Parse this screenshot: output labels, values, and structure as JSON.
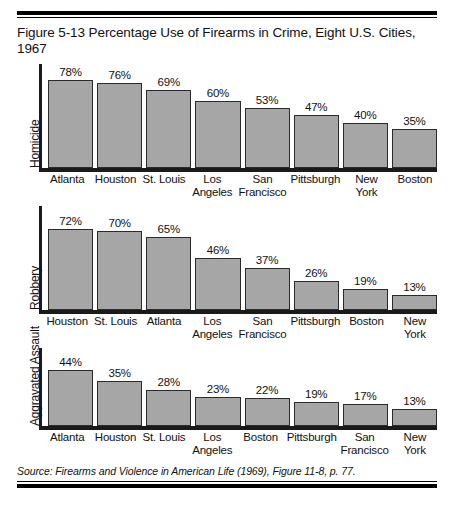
{
  "figure": {
    "title": "Figure 5-13 Percentage Use of Firearms in Crime, Eight U.S. Cities, 1967",
    "source": "Source: Firearms and Violence in American Life (1969), Figure 11-8, p. 77."
  },
  "chart_data": [
    {
      "type": "bar",
      "title": "Homicide",
      "ylabel": "Homicide",
      "xlabel": "",
      "ylim": [
        0,
        80
      ],
      "grid": false,
      "categories": [
        "Atlanta",
        "Houston",
        "St. Louis",
        "Los Angeles",
        "San Francisco",
        "Pittsburgh",
        "New York",
        "Boston"
      ],
      "values": [
        78,
        76,
        69,
        60,
        53,
        47,
        40,
        35
      ],
      "value_labels": [
        "78%",
        "76%",
        "69%",
        "60%",
        "53%",
        "47%",
        "40%",
        "35%"
      ]
    },
    {
      "type": "bar",
      "title": "Robbery",
      "ylabel": "Robbery",
      "xlabel": "",
      "ylim": [
        0,
        80
      ],
      "grid": false,
      "categories": [
        "Houston",
        "St. Louis",
        "Atlanta",
        "Los Angeles",
        "San Francisco",
        "Pittsburgh",
        "Boston",
        "New York"
      ],
      "values": [
        72,
        70,
        65,
        46,
        37,
        26,
        19,
        13
      ],
      "value_labels": [
        "72%",
        "70%",
        "65%",
        "46%",
        "37%",
        "26%",
        "19%",
        "13%"
      ]
    },
    {
      "type": "bar",
      "title": "Aggravated Assault",
      "ylabel": "Aggravated Assault",
      "xlabel": "",
      "ylim": [
        0,
        50
      ],
      "grid": false,
      "categories": [
        "Atlanta",
        "Houston",
        "St. Louis",
        "Los Angeles",
        "Boston",
        "Pittsburgh",
        "San Francisco",
        "New York"
      ],
      "values": [
        44,
        35,
        28,
        23,
        22,
        19,
        17,
        13
      ],
      "value_labels": [
        "44%",
        "35%",
        "28%",
        "23%",
        "22%",
        "19%",
        "17%",
        "13%"
      ]
    }
  ],
  "colors": {
    "bar_fill": "#a6a6a6",
    "bar_border": "#2b2b2b",
    "axis": "#1a1a1a",
    "text": "#111111",
    "background": "#ffffff"
  }
}
